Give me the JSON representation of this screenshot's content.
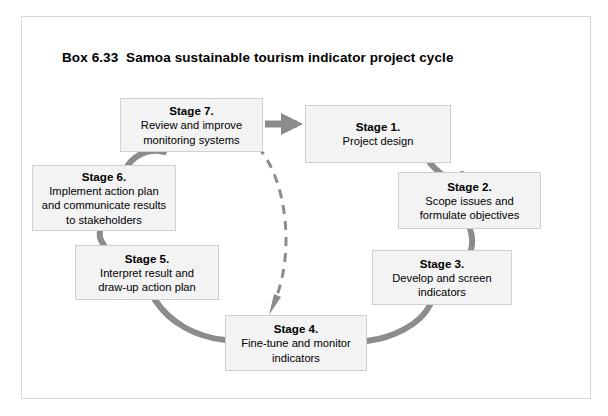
{
  "box": {
    "title": "Box 6.33  Samoa sustainable tourism indicator project cycle",
    "border_color": "#d8d8d8",
    "background": "#ffffff"
  },
  "diagram": {
    "type": "cycle-diagram",
    "arc_color": "#8c8c8c",
    "dashed_arrow_color": "#8c8c8c",
    "box_fill": "#f3f3f3",
    "box_border": "#cfcfcf",
    "stages": [
      {
        "id": "stage-7",
        "title": "Stage 7.",
        "desc": "Review and improve\nmonitoring systems"
      },
      {
        "id": "stage-1",
        "title": "Stage 1.",
        "desc": "Project design"
      },
      {
        "id": "stage-2",
        "title": "Stage 2.",
        "desc": "Scope issues and\nformulate objectives"
      },
      {
        "id": "stage-3",
        "title": "Stage 3.",
        "desc": "Develop and screen\nindicators"
      },
      {
        "id": "stage-4",
        "title": "Stage 4.",
        "desc": "Fine-tune and monitor\nindicators"
      },
      {
        "id": "stage-5",
        "title": "Stage 5.",
        "desc": "Interpret result and\ndraw-up action plan"
      },
      {
        "id": "stage-6",
        "title": "Stage 6.",
        "desc": "Implement action plan\nand communicate results\nto stakeholders"
      }
    ],
    "connectors": [
      {
        "name": "stage7-to-stage1",
        "style": "solid-arrow",
        "direction": "right"
      },
      {
        "name": "stage1-to-stage2",
        "style": "solid-arc"
      },
      {
        "name": "stage2-to-stage3",
        "style": "solid-arc"
      },
      {
        "name": "stage3-to-stage4",
        "style": "solid-arc"
      },
      {
        "name": "stage4-to-stage5",
        "style": "solid-arc"
      },
      {
        "name": "stage5-to-stage6",
        "style": "solid-arc"
      },
      {
        "name": "stage6-to-stage7",
        "style": "solid-arc"
      },
      {
        "name": "stage7-to-stage4-feedback",
        "style": "dashed-arrow"
      }
    ]
  }
}
